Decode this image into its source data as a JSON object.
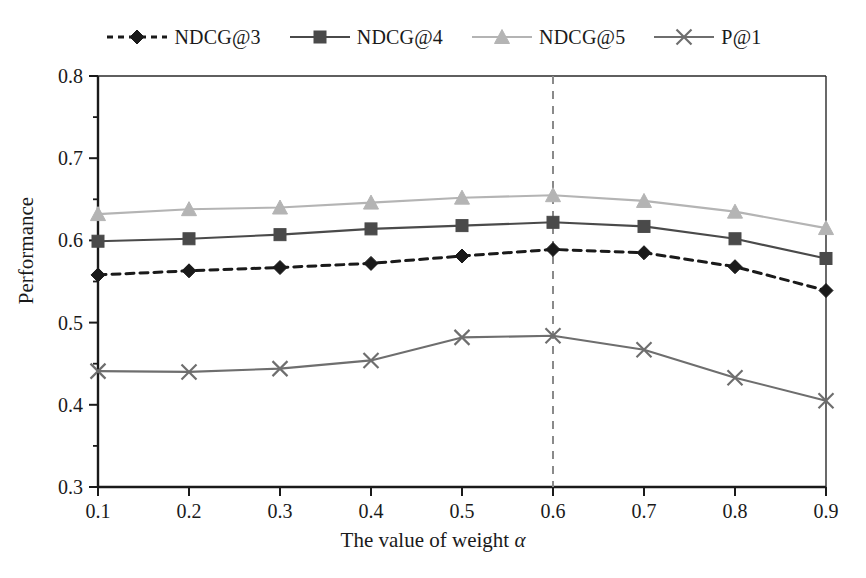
{
  "chart_data": {
    "type": "line",
    "title": "",
    "xlabel": "The value of weight α",
    "ylabel": "Performance",
    "x": [
      0.1,
      0.2,
      0.3,
      0.4,
      0.5,
      0.6,
      0.7,
      0.8,
      0.9
    ],
    "xtick_labels": [
      "0.1",
      "0.2",
      "0.3",
      "0.4",
      "0.5",
      "0.6",
      "0.7",
      "0.8",
      "0.9"
    ],
    "ytick_labels": [
      "0.3",
      "0.4",
      "0.5",
      "0.6",
      "0.7",
      "0.8"
    ],
    "yticks": [
      0.3,
      0.4,
      0.5,
      0.6,
      0.7,
      0.8
    ],
    "yminor_ticks": [
      0.35,
      0.45,
      0.55,
      0.65,
      0.75
    ],
    "xlim": [
      0.1,
      0.9
    ],
    "ylim": [
      0.3,
      0.8
    ],
    "grid": false,
    "legend_position": "top-center",
    "annotations": [
      {
        "type": "vline",
        "x": 0.6,
        "style": "dashed",
        "color": "#8a8a8a"
      }
    ],
    "series": [
      {
        "name": "NDCG@3",
        "marker": "diamond",
        "line_style": "dashed",
        "color": "#1a1a1a",
        "values": [
          0.558,
          0.563,
          0.567,
          0.572,
          0.581,
          0.589,
          0.585,
          0.568,
          0.539
        ]
      },
      {
        "name": "NDCG@4",
        "marker": "square",
        "line_style": "solid",
        "color": "#4a4a4a",
        "values": [
          0.599,
          0.602,
          0.607,
          0.614,
          0.618,
          0.622,
          0.617,
          0.602,
          0.578
        ]
      },
      {
        "name": "NDCG@5",
        "marker": "triangle",
        "line_style": "solid",
        "color": "#b4b4b4",
        "values": [
          0.632,
          0.638,
          0.64,
          0.646,
          0.652,
          0.655,
          0.648,
          0.635,
          0.615
        ]
      },
      {
        "name": "P@1",
        "marker": "cross",
        "line_style": "solid",
        "color": "#6e6e6e",
        "values": [
          0.441,
          0.44,
          0.444,
          0.454,
          0.482,
          0.484,
          0.467,
          0.433,
          0.405
        ]
      }
    ]
  },
  "legend": {
    "entries": [
      {
        "label": "NDCG@3"
      },
      {
        "label": "NDCG@4"
      },
      {
        "label": "NDCG@5"
      },
      {
        "label": "P@1"
      }
    ]
  },
  "axes": {
    "y_title": "Performance",
    "x_title_prefix": "The value of weight ",
    "x_title_symbol": "α"
  }
}
